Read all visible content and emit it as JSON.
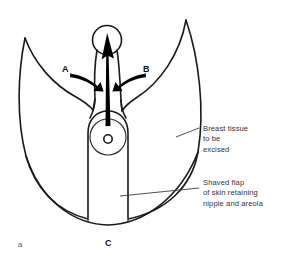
{
  "figure": {
    "index_label": "a",
    "domain_kind": "surgical-illustration",
    "background_color": "#ffffff",
    "line_color": "#1a1a1a",
    "text_color": "#333333"
  },
  "markers": [
    {
      "id": "a",
      "label": "A",
      "meaning": "medial flap advancement arrow"
    },
    {
      "id": "b",
      "label": "B",
      "meaning": "lateral flap advancement arrow"
    },
    {
      "id": "c",
      "label": "C",
      "meaning": "inframammary fold point"
    }
  ],
  "callouts": [
    {
      "id": "breast-tissue",
      "text": "Breast tissue\nto be\nexcised",
      "lines": [
        "Breast tissue",
        "to be",
        "excised"
      ]
    },
    {
      "id": "shaved-flap",
      "text": "Shaved flap\nof skin retaining\nnipple and areola",
      "lines": [
        "Shaved flap",
        "of skin retaining",
        "nipple and areola"
      ]
    }
  ],
  "anatomy": {
    "keyhole_label": "keyhole nipple aperture",
    "areola_label": "areola",
    "nipple_label": "nipple",
    "flap_label": "dermal pedicle flap",
    "excision_label": "excision outline"
  }
}
